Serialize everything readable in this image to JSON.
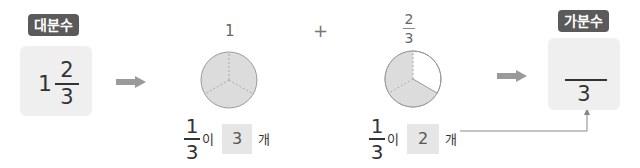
{
  "left": {
    "badge": "대분수",
    "whole": "1",
    "numerator": "2",
    "denominator": "3"
  },
  "middle1": {
    "top_label": "1",
    "pie": {
      "parts": 3,
      "shaded": 3
    },
    "unit_num": "1",
    "unit_den": "3",
    "particle": "이",
    "count": "3",
    "unit_word": "개"
  },
  "plus": "+",
  "middle2": {
    "top_num": "2",
    "top_den": "3",
    "pie": {
      "parts": 3,
      "shaded": 2
    },
    "unit_num": "1",
    "unit_den": "3",
    "particle": "이",
    "count": "2",
    "unit_word": "개"
  },
  "right": {
    "badge": "가분수",
    "numerator": "",
    "denominator": "3"
  },
  "colors": {
    "badge_bg": "#5a5a5a",
    "box_bg": "#efefef",
    "pie_fill": "#dcdcdc",
    "arrow": "#9a9a9a"
  }
}
